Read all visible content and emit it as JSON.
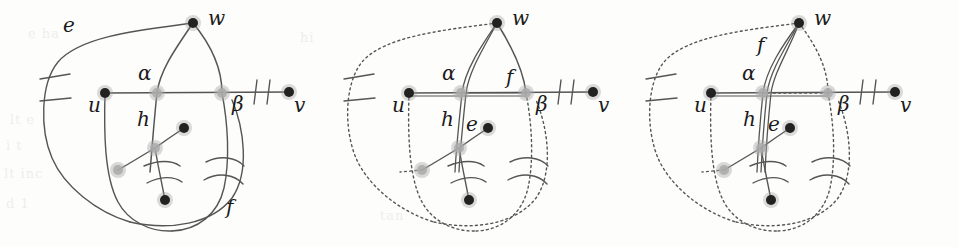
{
  "figure": {
    "type": "graph-theory-diagram",
    "background_color": "#fdfdfc",
    "stroke_color": "#555555",
    "node_fill": "#222222",
    "crossing_fill": "#aaaaaa",
    "label_color": "#1a1a1a",
    "panels": [
      {
        "id": "panel-1",
        "x_offset": 0,
        "style": "solid",
        "labels": [
          {
            "name": "label-e",
            "text": "e",
            "x": 63,
            "y": 32
          },
          {
            "name": "label-w",
            "text": "w",
            "x": 208,
            "y": 25
          },
          {
            "name": "label-alpha",
            "text": "α",
            "x": 138,
            "y": 80
          },
          {
            "name": "label-u",
            "text": "u",
            "x": 88,
            "y": 112
          },
          {
            "name": "label-h",
            "text": "h",
            "x": 137,
            "y": 126
          },
          {
            "name": "label-beta",
            "text": "β",
            "x": 232,
            "y": 111
          },
          {
            "name": "label-v",
            "text": "v",
            "x": 294,
            "y": 112
          },
          {
            "name": "label-f",
            "text": "f",
            "x": 226,
            "y": 214
          }
        ],
        "vertices": [
          {
            "name": "vertex-u",
            "x": 105,
            "y": 93,
            "kind": "solid"
          },
          {
            "name": "vertex-w",
            "x": 193,
            "y": 23,
            "kind": "solid"
          },
          {
            "name": "vertex-v",
            "x": 289,
            "y": 92,
            "kind": "solid"
          },
          {
            "name": "vertex-mid-upper",
            "x": 184,
            "y": 128,
            "kind": "solid"
          },
          {
            "name": "vertex-mid-lower",
            "x": 165,
            "y": 200,
            "kind": "solid"
          },
          {
            "name": "crossing-alpha",
            "x": 157,
            "y": 93,
            "kind": "crossing"
          },
          {
            "name": "crossing-beta",
            "x": 222,
            "y": 93,
            "kind": "crossing"
          },
          {
            "name": "crossing-h",
            "x": 155,
            "y": 148,
            "kind": "crossing"
          },
          {
            "name": "crossing-e-low",
            "x": 118,
            "y": 170,
            "kind": "crossing"
          }
        ]
      },
      {
        "id": "panel-2",
        "x_offset": 304,
        "style": "dotted-outer",
        "labels": [
          {
            "name": "label-w",
            "text": "w",
            "x": 512,
            "y": 25
          },
          {
            "name": "label-alpha",
            "text": "α",
            "x": 442,
            "y": 80
          },
          {
            "name": "label-f",
            "text": "f",
            "x": 506,
            "y": 84
          },
          {
            "name": "label-u",
            "text": "u",
            "x": 392,
            "y": 112
          },
          {
            "name": "label-h",
            "text": "h",
            "x": 441,
            "y": 126
          },
          {
            "name": "label-e",
            "text": "e",
            "x": 466,
            "y": 131
          },
          {
            "name": "label-beta",
            "text": "β",
            "x": 536,
            "y": 111
          },
          {
            "name": "label-v",
            "text": "v",
            "x": 598,
            "y": 112
          }
        ],
        "vertices": [
          {
            "name": "vertex-u",
            "x": 409,
            "y": 93,
            "kind": "solid"
          },
          {
            "name": "vertex-w",
            "x": 497,
            "y": 23,
            "kind": "solid"
          },
          {
            "name": "vertex-v",
            "x": 593,
            "y": 92,
            "kind": "solid"
          },
          {
            "name": "vertex-mid-upper",
            "x": 488,
            "y": 128,
            "kind": "solid"
          },
          {
            "name": "vertex-mid-lower",
            "x": 469,
            "y": 200,
            "kind": "solid"
          },
          {
            "name": "crossing-alpha",
            "x": 461,
            "y": 93,
            "kind": "crossing"
          },
          {
            "name": "crossing-beta",
            "x": 526,
            "y": 93,
            "kind": "crossing"
          },
          {
            "name": "crossing-h",
            "x": 459,
            "y": 148,
            "kind": "crossing"
          },
          {
            "name": "crossing-e-low",
            "x": 422,
            "y": 170,
            "kind": "crossing"
          }
        ]
      },
      {
        "id": "panel-3",
        "x_offset": 606,
        "style": "dotted-outer",
        "labels": [
          {
            "name": "label-w",
            "text": "w",
            "x": 814,
            "y": 25
          },
          {
            "name": "label-f",
            "text": "f",
            "x": 757,
            "y": 52
          },
          {
            "name": "label-alpha",
            "text": "α",
            "x": 742,
            "y": 80
          },
          {
            "name": "label-u",
            "text": "u",
            "x": 694,
            "y": 112
          },
          {
            "name": "label-h",
            "text": "h",
            "x": 743,
            "y": 126
          },
          {
            "name": "label-e",
            "text": "e",
            "x": 768,
            "y": 131
          },
          {
            "name": "label-beta",
            "text": "β",
            "x": 838,
            "y": 111
          },
          {
            "name": "label-v",
            "text": "v",
            "x": 900,
            "y": 112
          }
        ],
        "vertices": [
          {
            "name": "vertex-u",
            "x": 711,
            "y": 93,
            "kind": "solid"
          },
          {
            "name": "vertex-w",
            "x": 799,
            "y": 23,
            "kind": "solid"
          },
          {
            "name": "vertex-v",
            "x": 895,
            "y": 92,
            "kind": "solid"
          },
          {
            "name": "vertex-mid-upper",
            "x": 790,
            "y": 128,
            "kind": "solid"
          },
          {
            "name": "vertex-mid-lower",
            "x": 771,
            "y": 200,
            "kind": "solid"
          },
          {
            "name": "crossing-alpha",
            "x": 763,
            "y": 93,
            "kind": "crossing"
          },
          {
            "name": "crossing-beta",
            "x": 828,
            "y": 93,
            "kind": "crossing"
          },
          {
            "name": "crossing-h",
            "x": 761,
            "y": 148,
            "kind": "crossing"
          },
          {
            "name": "crossing-e-low",
            "x": 724,
            "y": 170,
            "kind": "crossing"
          }
        ]
      }
    ],
    "ghost_text": [
      {
        "text": "e ha",
        "x": 28,
        "y": 26
      },
      {
        "text": "lt e",
        "x": 10,
        "y": 112
      },
      {
        "text": "i t",
        "x": 6,
        "y": 138
      },
      {
        "text": "lt inc",
        "x": 4,
        "y": 166
      },
      {
        "text": "d 1",
        "x": 6,
        "y": 196
      },
      {
        "text": "hi",
        "x": 300,
        "y": 30
      },
      {
        "text": "tan",
        "x": 380,
        "y": 208
      }
    ]
  }
}
